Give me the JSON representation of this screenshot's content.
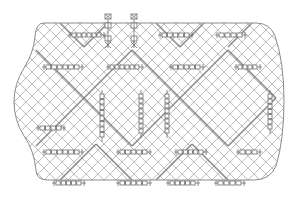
{
  "diagram": {
    "type": "mesh-panel-drawing",
    "colors": {
      "background": "#ffffff",
      "outline": "#8a8a8a",
      "lattice": "#b5b5b5",
      "reinforcement": "#7a7a7a",
      "clip": "#6d6d6d"
    },
    "panel": {
      "bbox": {
        "x": 22,
        "y": 22,
        "w": 248,
        "h": 168
      },
      "lattice_pitch": 12
    },
    "top_connectors": [
      {
        "x": 108,
        "y": 14
      },
      {
        "x": 134,
        "y": 14
      }
    ],
    "horizontal_clips": [
      {
        "x": 72,
        "y": 35,
        "len": 30
      },
      {
        "x": 162,
        "y": 35,
        "len": 28
      },
      {
        "x": 219,
        "y": 35,
        "len": 24
      },
      {
        "x": 46,
        "y": 67,
        "len": 34
      },
      {
        "x": 110,
        "y": 67,
        "len": 30
      },
      {
        "x": 173,
        "y": 67,
        "len": 28
      },
      {
        "x": 238,
        "y": 67,
        "len": 20
      },
      {
        "x": 40,
        "y": 128,
        "len": 22
      },
      {
        "x": 46,
        "y": 152,
        "len": 34
      },
      {
        "x": 120,
        "y": 152,
        "len": 28
      },
      {
        "x": 178,
        "y": 152,
        "len": 26
      },
      {
        "x": 240,
        "y": 152,
        "len": 18
      },
      {
        "x": 56,
        "y": 183,
        "len": 26
      },
      {
        "x": 120,
        "y": 183,
        "len": 28
      },
      {
        "x": 170,
        "y": 183,
        "len": 26
      },
      {
        "x": 218,
        "y": 183,
        "len": 24
      }
    ],
    "vertical_clips": [
      {
        "x": 102,
        "y": 94,
        "len": 44
      },
      {
        "x": 141,
        "y": 94,
        "len": 40
      },
      {
        "x": 167,
        "y": 94,
        "len": 40
      },
      {
        "x": 270,
        "y": 94,
        "len": 36
      }
    ]
  }
}
